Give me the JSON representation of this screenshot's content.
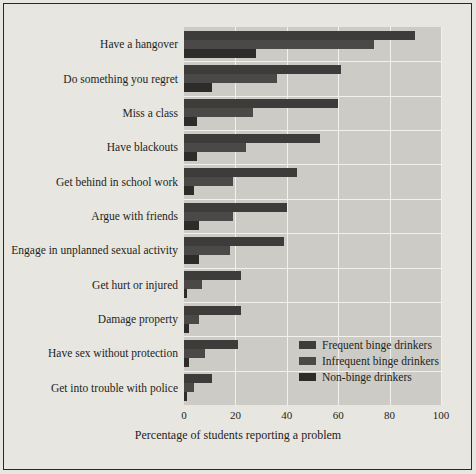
{
  "chart_data": {
    "type": "bar",
    "orientation": "horizontal",
    "title": "",
    "xlabel": "Percentage of students reporting a problem",
    "ylabel": "",
    "xlim": [
      0,
      100
    ],
    "xticks": [
      0,
      20,
      40,
      60,
      80,
      100
    ],
    "grid": true,
    "legend_position": "center-right",
    "categories": [
      "Have a hangover",
      "Do something you regret",
      "Miss a class",
      "Have blackouts",
      "Get behind in school work",
      "Argue with friends",
      "Engage in unplanned sexual activity",
      "Get hurt or injured",
      "Damage property",
      "Have sex without protection",
      "Get into trouble with police"
    ],
    "series": [
      {
        "name": "Frequent binge drinkers",
        "color": "#3e3c3a",
        "values": [
          90,
          61,
          60,
          53,
          44,
          40,
          39,
          22,
          22,
          21,
          11
        ]
      },
      {
        "name": "Infrequent binge drinkers",
        "color": "#4b4947",
        "values": [
          74,
          36,
          27,
          24,
          19,
          19,
          18,
          7,
          6,
          8,
          4
        ]
      },
      {
        "name": "Non-binge drinkers",
        "color": "#2e2c2b",
        "values": [
          28,
          11,
          5,
          5,
          4,
          6,
          6,
          1,
          2,
          2,
          1
        ]
      }
    ]
  },
  "axis": {
    "tick_labels": [
      "0",
      "20",
      "40",
      "60",
      "80",
      "100"
    ],
    "x_title": "Percentage of students reporting a problem"
  },
  "legend": {
    "items": [
      "Frequent binge drinkers",
      "Infrequent binge drinkers",
      "Non-binge drinkers"
    ]
  }
}
